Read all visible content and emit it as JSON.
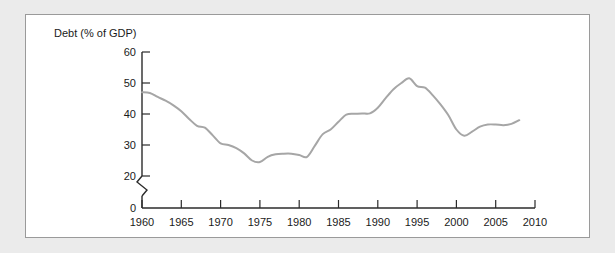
{
  "figure": {
    "axis_title": "Debt (% of GDP)"
  },
  "chart_data": {
    "type": "line",
    "title": "",
    "xlabel": "",
    "ylabel": "Debt (% of GDP)",
    "xlim": [
      1960,
      2010
    ],
    "ylim": [
      0,
      60
    ],
    "y_axis_break": true,
    "y_break_between": [
      0,
      20
    ],
    "grid": false,
    "legend": null,
    "line_color": "#a6a6a6",
    "axis_color": "#2b2b2b",
    "xticks": [
      1960,
      1965,
      1970,
      1975,
      1980,
      1985,
      1990,
      1995,
      2000,
      2005,
      2010
    ],
    "xtick_labels": [
      "1960",
      "1965",
      "1970",
      "1975",
      "1980",
      "1985",
      "1990",
      "1995",
      "2000",
      "2005",
      "2010"
    ],
    "yticks": [
      0,
      20,
      30,
      40,
      50,
      60
    ],
    "ytick_labels": [
      "0",
      "20",
      "30",
      "40",
      "50",
      "60"
    ],
    "x": [
      1960,
      1961,
      1962,
      1963,
      1964,
      1965,
      1966,
      1967,
      1968,
      1969,
      1970,
      1971,
      1972,
      1973,
      1974,
      1975,
      1976,
      1977,
      1978,
      1979,
      1980,
      1981,
      1982,
      1983,
      1984,
      1985,
      1986,
      1987,
      1988,
      1989,
      1990,
      1991,
      1992,
      1993,
      1994,
      1995,
      1996,
      1997,
      1998,
      1999,
      2000,
      2001,
      2002,
      2003,
      2004,
      2005,
      2006,
      2007,
      2008
    ],
    "values": [
      47.0,
      46.8,
      45.5,
      44.3,
      42.8,
      40.9,
      38.4,
      36.2,
      35.6,
      33.1,
      30.5,
      30.0,
      29.0,
      27.3,
      25.0,
      24.5,
      26.2,
      27.0,
      27.2,
      27.2,
      26.8,
      26.2,
      29.8,
      33.5,
      35.0,
      37.5,
      39.8,
      40.1,
      40.2,
      40.2,
      42.0,
      45.1,
      48.0,
      50.0,
      51.5,
      49.0,
      48.5,
      46.0,
      43.0,
      39.5,
      35.0,
      33.0,
      34.3,
      35.9,
      36.6,
      36.6,
      36.4,
      36.8,
      38.0
    ]
  }
}
